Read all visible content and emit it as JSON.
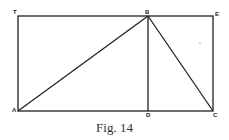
{
  "figure": {
    "caption": "Fig. 14",
    "labels": {
      "T": "T",
      "B": "B",
      "E": "E",
      "A": "A",
      "D": "D",
      "C": "C"
    },
    "stroke_color": "#222222"
  }
}
